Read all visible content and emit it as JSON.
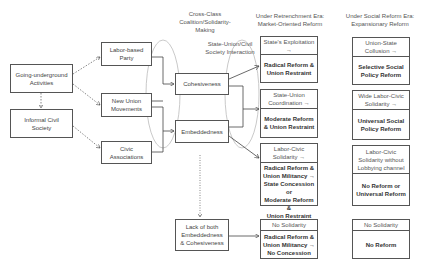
{
  "headers": {
    "coalition": "Cross-Class\nCoalition/Solidarity-\nMaking",
    "interaction": "State-Union/Civil\nSociety Interaction",
    "retrenchment": "Under Retrenchment Era:\nMarket-Oriented Reform",
    "social_reform": "Under Social Reform Era:\nExpansionary Reform"
  },
  "origins": {
    "going_underground": "Going-underground\nActivities",
    "informal_civil_society": "Informal Civil\nSociety"
  },
  "actors": {
    "labor_party": "Labor-based\nParty",
    "new_union": "New Union\nMovements",
    "civic": "Civic\nAssociations"
  },
  "mechanisms": {
    "cohesiveness": "Cohesiveness",
    "embeddedness": "Embeddedness",
    "lack_both": "Lack of both\nEmbeddedness\n& Cohesiveness"
  },
  "retrenchment_outcomes": [
    {
      "condition": "State's Exploitation\n→",
      "result": "Radical Reform &\nUnion Restraint"
    },
    {
      "condition": "State-Union\nCoordination →",
      "result": "Moderate Reform\n& Union Restraint"
    },
    {
      "condition": "Labor-Civic\nSolidarity →",
      "result": "Radical Reform &\nUnion Militancy →\nState Concession or\nModerate Reform &\nUnion Restraint"
    },
    {
      "condition": "No Solidarity",
      "result": "Radical Reform &\nUnion Militancy →\nNo Concession"
    }
  ],
  "social_reform_outcomes": [
    {
      "condition": "Union-State\nCollusion →",
      "result": "Selective Social\nPolicy Reform"
    },
    {
      "condition": "Wide Labor-Civic\nSolidarity →",
      "result": "Universal Social\nPolicy Reform"
    },
    {
      "condition": "Labor-Civic\nSolidarity without\nLobbying channel",
      "result": "No Reform or\nUniversal Reform"
    },
    {
      "condition": "No Solidarity",
      "result": "No Reform"
    }
  ]
}
